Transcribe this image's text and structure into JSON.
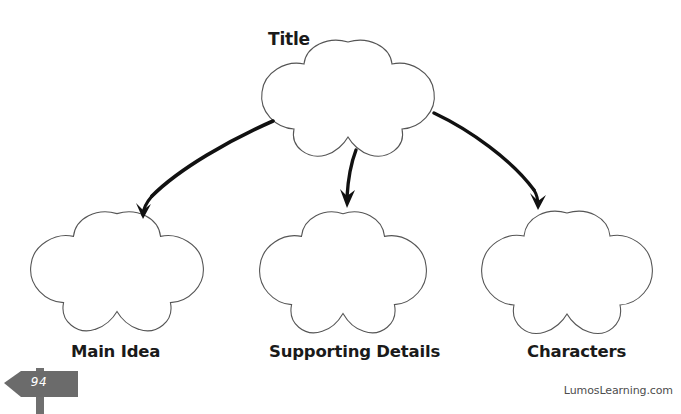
{
  "page": {
    "width": 681,
    "height": 414,
    "background": "#ffffff",
    "header_remnant_left": "",
    "header_remnant_right": ""
  },
  "worksheet": {
    "title_label": "Title",
    "nodes": [
      {
        "id": "title",
        "label": "Title",
        "shape": "five-lobe-flower",
        "label_position": "above"
      },
      {
        "id": "main-idea",
        "label": "Main Idea",
        "shape": "five-lobe-flower",
        "label_position": "below"
      },
      {
        "id": "supporting",
        "label": "Supporting Details",
        "shape": "five-lobe-flower",
        "label_position": "below"
      },
      {
        "id": "characters",
        "label": "Characters",
        "shape": "five-lobe-flower",
        "label_position": "below"
      }
    ],
    "connectors": [
      {
        "id": "arrow-title-to-main-idea",
        "from": "title",
        "to": "main-idea",
        "style": "curved-arrow-left"
      },
      {
        "id": "arrow-title-to-supporting",
        "from": "title",
        "to": "supporting",
        "style": "short-arrow-down"
      },
      {
        "id": "arrow-title-to-characters",
        "from": "title",
        "to": "characters",
        "style": "curved-arrow-right"
      }
    ],
    "outline_color": "#555555",
    "arrow_color": "#111111",
    "text_color": "#1a1a1a"
  },
  "footer": {
    "page_number": "94",
    "signpost_color": "#6b6b6b",
    "signpost_post_color": "#6f6f6f",
    "page_number_color": "#ffffff",
    "brand": "LumosLearning.com",
    "brand_color": "#4d4d4d"
  }
}
